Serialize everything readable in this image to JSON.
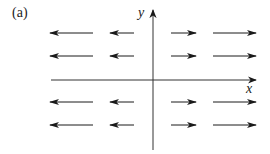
{
  "figure": {
    "panel_label": "(a)",
    "x_axis_label": "x",
    "y_axis_label": "y",
    "colors": {
      "ink": "#1a1a1a",
      "background": "#ffffff"
    },
    "axes": {
      "origin": [
        153,
        80
      ],
      "x_axis": {
        "from": [
          51,
          80
        ],
        "to": [
          256,
          80
        ]
      },
      "y_axis": {
        "from": [
          153,
          150
        ],
        "to": [
          153,
          10
        ]
      }
    },
    "arrow_rows_y": [
      33,
      56,
      102,
      125
    ],
    "arrows": [
      {
        "row": 0,
        "from": 93,
        "to": 50,
        "direction": "left",
        "length": "long"
      },
      {
        "row": 0,
        "from": 134,
        "to": 110,
        "direction": "left",
        "length": "short"
      },
      {
        "row": 0,
        "from": 171,
        "to": 196,
        "direction": "right",
        "length": "short"
      },
      {
        "row": 0,
        "from": 213,
        "to": 256,
        "direction": "right",
        "length": "long"
      },
      {
        "row": 1,
        "from": 93,
        "to": 50,
        "direction": "left",
        "length": "long"
      },
      {
        "row": 1,
        "from": 134,
        "to": 110,
        "direction": "left",
        "length": "short"
      },
      {
        "row": 1,
        "from": 171,
        "to": 196,
        "direction": "right",
        "length": "short"
      },
      {
        "row": 1,
        "from": 213,
        "to": 256,
        "direction": "right",
        "length": "long"
      },
      {
        "row": 2,
        "from": 93,
        "to": 50,
        "direction": "left",
        "length": "long"
      },
      {
        "row": 2,
        "from": 134,
        "to": 110,
        "direction": "left",
        "length": "short"
      },
      {
        "row": 2,
        "from": 171,
        "to": 196,
        "direction": "right",
        "length": "short"
      },
      {
        "row": 2,
        "from": 213,
        "to": 256,
        "direction": "right",
        "length": "long"
      },
      {
        "row": 3,
        "from": 93,
        "to": 50,
        "direction": "left",
        "length": "long"
      },
      {
        "row": 3,
        "from": 134,
        "to": 110,
        "direction": "left",
        "length": "short"
      },
      {
        "row": 3,
        "from": 171,
        "to": 196,
        "direction": "right",
        "length": "short"
      },
      {
        "row": 3,
        "from": 213,
        "to": 256,
        "direction": "right",
        "length": "long"
      }
    ]
  }
}
